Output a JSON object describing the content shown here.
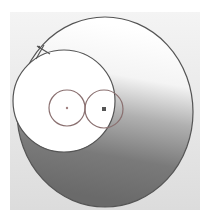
{
  "diagram": {
    "background": {
      "from": "#f2f2f2",
      "to": "#d8d8d8"
    },
    "large_circle": {
      "cx": 105,
      "cy": 112,
      "rx": 88,
      "ry": 95,
      "stroke": "#555555",
      "gradient": {
        "top": "#ffffff",
        "mid": "#b8b8b8",
        "bottom": "#6a6a6a"
      }
    },
    "white_circle": {
      "cx": 64,
      "cy": 101,
      "r": 51,
      "fill": "#ffffff",
      "stroke": "#555555"
    },
    "small_circles": [
      {
        "cx": 67,
        "cy": 108,
        "r": 18,
        "stroke": "#8a7070",
        "marker": "dot"
      },
      {
        "cx": 104,
        "cy": 109,
        "r": 19,
        "stroke": "#8a7070",
        "marker": "square"
      }
    ],
    "handle": {
      "x": 42,
      "y": 49
    }
  }
}
